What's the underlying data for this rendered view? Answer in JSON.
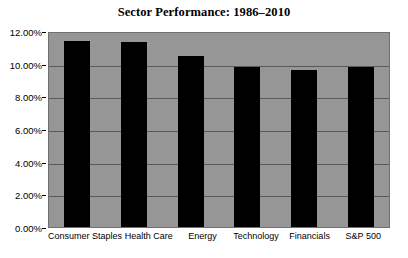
{
  "chart_data": {
    "type": "bar",
    "title": "Sector Performance: 1986–2010",
    "xlabel": "",
    "ylabel": "",
    "categories": [
      "Consumer Staples",
      "Health Care",
      "Energy",
      "Technology",
      "Financials",
      "S&P 500"
    ],
    "values": [
      11.4,
      11.3,
      10.5,
      9.8,
      9.6,
      9.8
    ],
    "value_labels": [
      "11.40%",
      "11.30%",
      "10.50%",
      "9.80%",
      "9.60%",
      "9.80%"
    ],
    "ylim": [
      0,
      12
    ],
    "ytick_values": [
      0,
      2,
      4,
      6,
      8,
      10,
      12
    ],
    "ytick_labels": [
      "0.00%",
      "2.00%",
      "4.00%",
      "6.00%",
      "8.00%",
      "10.00%",
      "12.00%"
    ],
    "grid": true,
    "legend": false,
    "series": [
      {
        "name": "Annualized Return",
        "values": [
          11.4,
          11.3,
          10.5,
          9.8,
          9.6,
          9.8
        ]
      }
    ],
    "colors": {
      "bar": "#000000",
      "plot_background": "#969696",
      "gridline": "#5a5a5a",
      "figure_background": "#ffffff",
      "text": "#000000"
    }
  }
}
